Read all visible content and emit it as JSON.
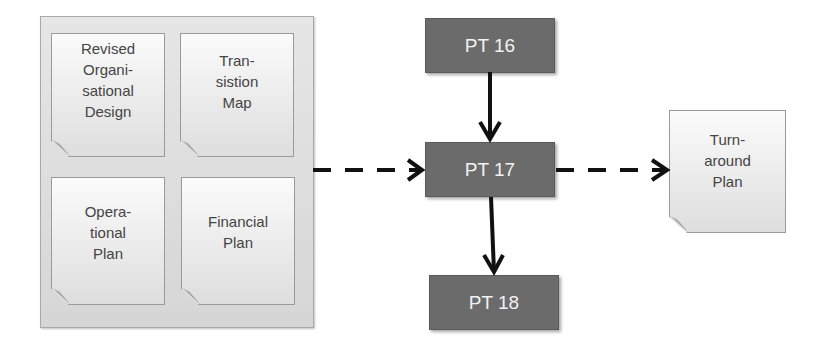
{
  "diagram": {
    "inputs_group": {
      "documents": [
        {
          "label": "Revised\nOrgani-\nsational\nDesign"
        },
        {
          "label": "Tran-\nsistion\nMap"
        },
        {
          "label": "Opera-\ntional\nPlan"
        },
        {
          "label": "Financial\nPlan"
        }
      ]
    },
    "process_boxes": [
      {
        "label": "PT 16"
      },
      {
        "label": "PT 17"
      },
      {
        "label": "PT 18"
      }
    ],
    "output_document": {
      "label": "Turn-\naround\nPlan"
    },
    "connectors": [
      {
        "from": "inputs_group",
        "to": "PT 17",
        "style": "dashed"
      },
      {
        "from": "PT 16",
        "to": "PT 17",
        "style": "solid"
      },
      {
        "from": "PT 17",
        "to": "PT 18",
        "style": "solid"
      },
      {
        "from": "PT 17",
        "to": "Turnaround Plan",
        "style": "dashed"
      }
    ],
    "colors": {
      "process_box": "#6b6b6b",
      "process_text": "#f2f2f2",
      "document_text": "#444444",
      "arrow": "#111111"
    }
  }
}
